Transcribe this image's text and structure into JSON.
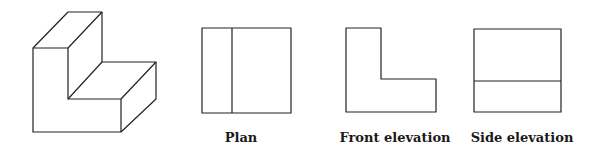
{
  "labels": {
    "plan": "Plan",
    "front": "Front elevation",
    "side": "Side elevation"
  },
  "colors": {
    "line": "#222222",
    "background": "#ffffff"
  }
}
